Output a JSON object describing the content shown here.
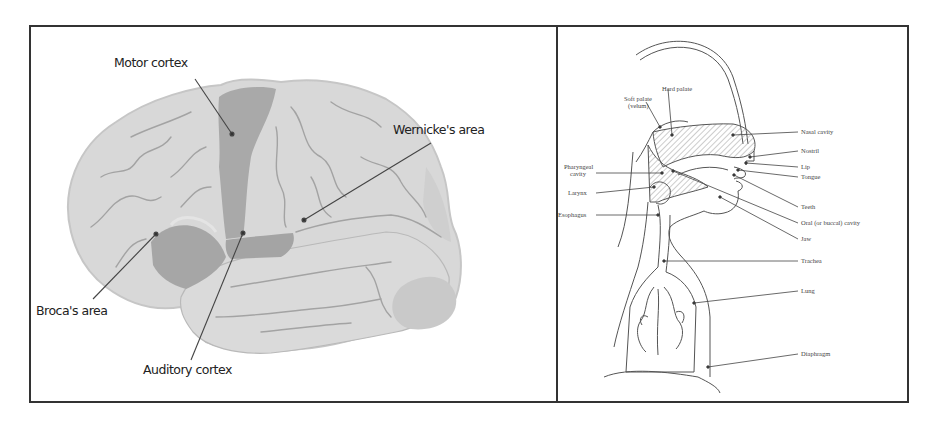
{
  "figure": {
    "brain_diagram": {
      "labels": {
        "motor_cortex": "Motor cortex",
        "wernickes_area": "Wernicke's area",
        "brocas_area": "Broca's area",
        "auditory_cortex": "Auditory cortex"
      },
      "colors": {
        "brain_fill": "#d6d6d6",
        "highlight_fill": "#a9a9a9",
        "sulci": "#9a9a9a",
        "leader_line": "#444444"
      }
    },
    "speech_anatomy_diagram": {
      "labels": {
        "hard_palate": "Hard palate",
        "soft_palate_line1": "Soft palate",
        "soft_palate_line2": "(velum)",
        "nasal_cavity": "Nasal cavity",
        "nostril": "Nostril",
        "lip": "Lip",
        "tongue": "Tongue",
        "pharyngeal_cavity_line1": "Pharyngeal",
        "pharyngeal_cavity_line2": "cavity",
        "larynx": "Larynx",
        "esophagus": "Esophagus",
        "teeth": "Teeth",
        "oral_cavity": "Oral (or buccal) cavity",
        "jaw": "Jaw",
        "trachea": "Trachea",
        "lung": "Lung",
        "diaphragm": "Diaphragm"
      },
      "colors": {
        "line": "#555555",
        "hatch": "#bdbdbd"
      }
    },
    "border_color": "#333333"
  }
}
